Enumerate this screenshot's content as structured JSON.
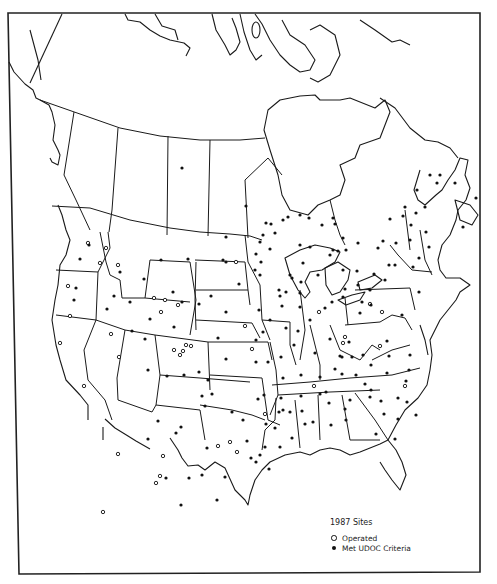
{
  "map": {
    "title": "1987 Sites",
    "region": "North America (Canada, United States, northern Mexico)",
    "legend": {
      "title": "1987 Sites",
      "items": [
        {
          "symbol": "open-circle",
          "label": "Operated"
        },
        {
          "symbol": "filled-circle",
          "label": "Met UDOC Criteria"
        }
      ]
    },
    "colors": {
      "ink": "#1a1a1a",
      "background": "#ffffff"
    },
    "sites_operated": [
      [
        88,
        243
      ],
      [
        118,
        265
      ],
      [
        68,
        286
      ],
      [
        100,
        263
      ],
      [
        106,
        248
      ],
      [
        178,
        305
      ],
      [
        154,
        298
      ],
      [
        165,
        300
      ],
      [
        161,
        312
      ],
      [
        191,
        346
      ],
      [
        174,
        350
      ],
      [
        180,
        355
      ],
      [
        186,
        345
      ],
      [
        183,
        351
      ],
      [
        70,
        316
      ],
      [
        60,
        343
      ],
      [
        84,
        386
      ],
      [
        111,
        334
      ],
      [
        119,
        357
      ],
      [
        118,
        454
      ],
      [
        163,
        456
      ],
      [
        103,
        512
      ],
      [
        236,
        262
      ],
      [
        218,
        446
      ],
      [
        265,
        414
      ],
      [
        252,
        349
      ],
      [
        156,
        483
      ],
      [
        160,
        476
      ],
      [
        314,
        386
      ],
      [
        345,
        337
      ],
      [
        343,
        343
      ],
      [
        370,
        304
      ],
      [
        382,
        312
      ],
      [
        319,
        312
      ],
      [
        380,
        346
      ],
      [
        405,
        386
      ],
      [
        245,
        326
      ],
      [
        230,
        442
      ],
      [
        237,
        452
      ]
    ],
    "sites_met": [
      [
        89,
        245
      ],
      [
        80,
        259
      ],
      [
        120,
        272
      ],
      [
        161,
        260
      ],
      [
        188,
        259
      ],
      [
        144,
        279
      ],
      [
        173,
        292
      ],
      [
        130,
        302
      ],
      [
        114,
        296
      ],
      [
        107,
        309
      ],
      [
        76,
        288
      ],
      [
        74,
        300
      ],
      [
        145,
        339
      ],
      [
        150,
        319
      ],
      [
        182,
        302
      ],
      [
        132,
        331
      ],
      [
        148,
        370
      ],
      [
        174,
        327
      ],
      [
        199,
        304
      ],
      [
        211,
        296
      ],
      [
        226,
        262
      ],
      [
        223,
        260
      ],
      [
        239,
        284
      ],
      [
        226,
        312
      ],
      [
        218,
        338
      ],
      [
        167,
        376
      ],
      [
        184,
        375
      ],
      [
        199,
        372
      ],
      [
        148,
        439
      ],
      [
        158,
        421
      ],
      [
        176,
        433
      ],
      [
        181,
        427
      ],
      [
        202,
        475
      ],
      [
        232,
        412
      ],
      [
        243,
        420
      ],
      [
        247,
        441
      ],
      [
        181,
        505
      ],
      [
        189,
        478
      ],
      [
        166,
        478
      ],
      [
        266,
        424
      ],
      [
        279,
        412
      ],
      [
        290,
        412
      ],
      [
        280,
        447
      ],
      [
        225,
        477
      ],
      [
        217,
        500
      ],
      [
        207,
        448
      ],
      [
        251,
        458
      ],
      [
        256,
        462
      ],
      [
        275,
        428
      ],
      [
        305,
        424
      ],
      [
        329,
        403
      ],
      [
        331,
        425
      ],
      [
        346,
        420
      ],
      [
        371,
        390
      ],
      [
        387,
        373
      ],
      [
        407,
        402
      ],
      [
        256,
        340
      ],
      [
        283,
        378
      ],
      [
        301,
        375
      ],
      [
        301,
        396
      ],
      [
        294,
        345
      ],
      [
        315,
        353
      ],
      [
        263,
        332
      ],
      [
        282,
        306
      ],
      [
        279,
        290
      ],
      [
        290,
        275
      ],
      [
        301,
        282
      ],
      [
        260,
        275
      ],
      [
        256,
        254
      ],
      [
        270,
        249
      ],
      [
        263,
        235
      ],
      [
        275,
        233
      ],
      [
        266,
        223
      ],
      [
        271,
        224
      ],
      [
        283,
        220
      ],
      [
        288,
        217
      ],
      [
        300,
        215
      ],
      [
        309,
        218
      ],
      [
        261,
        262
      ],
      [
        255,
        270
      ],
      [
        300,
        245
      ],
      [
        310,
        247
      ],
      [
        303,
        263
      ],
      [
        292,
        278
      ],
      [
        300,
        293
      ],
      [
        322,
        225
      ],
      [
        333,
        218
      ],
      [
        335,
        224
      ],
      [
        333,
        250
      ],
      [
        343,
        238
      ],
      [
        346,
        250
      ],
      [
        330,
        255
      ],
      [
        338,
        251
      ],
      [
        358,
        243
      ],
      [
        378,
        248
      ],
      [
        383,
        241
      ],
      [
        390,
        219
      ],
      [
        405,
        207
      ],
      [
        403,
        216
      ],
      [
        410,
        240
      ],
      [
        411,
        225
      ],
      [
        426,
        232
      ],
      [
        417,
        190
      ],
      [
        430,
        175
      ],
      [
        437,
        183
      ],
      [
        416,
        213
      ],
      [
        396,
        243
      ],
      [
        395,
        265
      ],
      [
        413,
        267
      ],
      [
        385,
        280
      ],
      [
        370,
        290
      ],
      [
        371,
        305
      ],
      [
        360,
        313
      ],
      [
        402,
        315
      ],
      [
        410,
        355
      ],
      [
        406,
        381
      ],
      [
        398,
        398
      ],
      [
        384,
        414
      ],
      [
        376,
        434
      ],
      [
        395,
        439
      ],
      [
        416,
        415
      ],
      [
        409,
        370
      ],
      [
        387,
        341
      ],
      [
        349,
        342
      ],
      [
        340,
        356
      ],
      [
        335,
        369
      ],
      [
        365,
        384
      ],
      [
        356,
        375
      ],
      [
        326,
        392
      ],
      [
        342,
        374
      ],
      [
        352,
        357
      ],
      [
        313,
        422
      ],
      [
        342,
        357
      ],
      [
        371,
        365
      ],
      [
        363,
        355
      ],
      [
        389,
        356
      ],
      [
        286,
        328
      ],
      [
        300,
        307
      ],
      [
        325,
        308
      ],
      [
        343,
        297
      ],
      [
        332,
        302
      ],
      [
        318,
        275
      ],
      [
        357,
        271
      ],
      [
        358,
        285
      ],
      [
        362,
        302
      ],
      [
        345,
        289
      ],
      [
        281,
        357
      ],
      [
        268,
        362
      ],
      [
        256,
        362
      ],
      [
        226,
        359
      ],
      [
        208,
        380
      ],
      [
        212,
        394
      ],
      [
        202,
        396
      ],
      [
        205,
        406
      ],
      [
        265,
        447
      ],
      [
        260,
        455
      ],
      [
        269,
        469
      ],
      [
        182,
        168
      ],
      [
        246,
        206
      ],
      [
        226,
        237
      ],
      [
        260,
        242
      ],
      [
        280,
        296
      ],
      [
        286,
        292
      ],
      [
        425,
        207
      ],
      [
        455,
        183
      ],
      [
        463,
        227
      ],
      [
        476,
        198
      ],
      [
        440,
        175
      ],
      [
        419,
        258
      ],
      [
        429,
        247
      ],
      [
        419,
        292
      ],
      [
        343,
        270
      ],
      [
        374,
        274
      ],
      [
        389,
        265
      ],
      [
        270,
        320
      ],
      [
        259,
        310
      ],
      [
        298,
        331
      ],
      [
        310,
        320
      ],
      [
        258,
        399
      ],
      [
        264,
        395
      ],
      [
        281,
        398
      ],
      [
        283,
        410
      ],
      [
        292,
        438
      ],
      [
        302,
        411
      ],
      [
        320,
        377
      ],
      [
        320,
        394
      ],
      [
        330,
        339
      ],
      [
        370,
        397
      ],
      [
        381,
        401
      ],
      [
        398,
        419
      ],
      [
        350,
        400
      ],
      [
        345,
        409
      ]
    ],
    "frame": {
      "left": 11,
      "top": 13,
      "right": 480,
      "bottom": 572
    }
  }
}
